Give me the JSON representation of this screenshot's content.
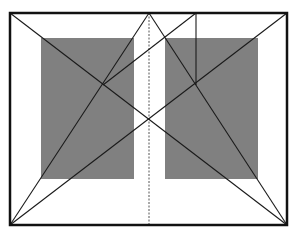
{
  "diagram": {
    "width": 298,
    "height": 238,
    "colors": {
      "background": "#ffffff",
      "frame": "#111111",
      "lines": "#1a1a1a",
      "text_block": "#808080",
      "spine": "#555555"
    },
    "frame": {
      "x": 10,
      "y": 13,
      "w": 277,
      "h": 212
    },
    "spine": {
      "x": 149,
      "y1": 13,
      "y2": 225,
      "style": "dashed"
    },
    "text_blocks": [
      {
        "name": "left-text-block",
        "x": 41,
        "y": 38,
        "w": 93,
        "h": 141
      },
      {
        "name": "right-text-block",
        "x": 165,
        "y": 38,
        "w": 93,
        "h": 141
      }
    ],
    "lines": [
      {
        "name": "spread-diagonal-tl-br",
        "x1": 10,
        "y1": 13,
        "x2": 287,
        "y2": 225
      },
      {
        "name": "spread-diagonal-tr-bl",
        "x1": 287,
        "y1": 13,
        "x2": 10,
        "y2": 225
      },
      {
        "name": "left-page-diagonal",
        "x1": 10,
        "y1": 225,
        "x2": 149,
        "y2": 13
      },
      {
        "name": "right-page-diagonal",
        "x1": 287,
        "y1": 225,
        "x2": 149,
        "y2": 13
      },
      {
        "name": "vertical-construction-line",
        "x1": 196,
        "y1": 13,
        "x2": 196,
        "y2": 85
      },
      {
        "name": "connector-line",
        "x1": 196,
        "y1": 13,
        "x2": 103,
        "y2": 85
      }
    ]
  }
}
